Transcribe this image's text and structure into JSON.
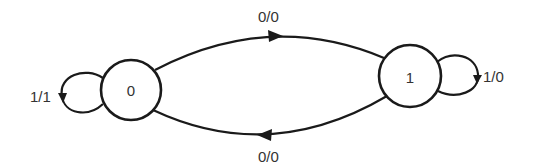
{
  "diagram": {
    "type": "state-machine",
    "states": [
      {
        "id": "s0",
        "label": "0"
      },
      {
        "id": "s1",
        "label": "1"
      }
    ],
    "transitions": [
      {
        "from": "0",
        "to": "1",
        "label": "0/0",
        "position": "top"
      },
      {
        "from": "1",
        "to": "0",
        "label": "0/0",
        "position": "bottom"
      },
      {
        "from": "0",
        "to": "0",
        "label": "1/1",
        "position": "left-self-loop"
      },
      {
        "from": "1",
        "to": "1",
        "label": "1/0",
        "position": "right-self-loop"
      }
    ],
    "colors": {
      "stroke": "#1a1a1a",
      "text": "#333333",
      "background": "#ffffff"
    }
  }
}
